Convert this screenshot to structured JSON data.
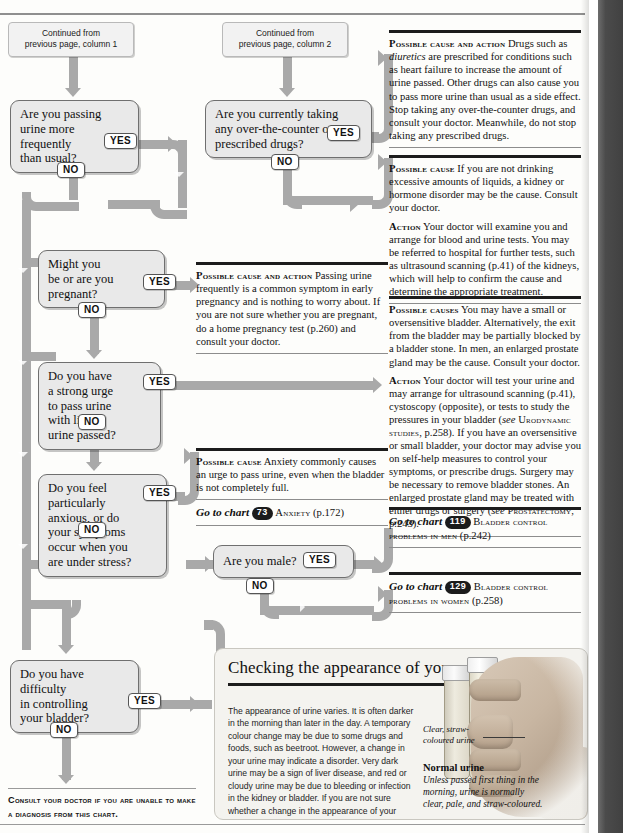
{
  "continued": {
    "col1": "Continued from\nprevious page, column 1",
    "col2": "Continued from\nprevious page, column 2"
  },
  "answers": {
    "yes": "YES",
    "no": "NO"
  },
  "questions": {
    "q_frequency": "Are you passing\nurine more\nfrequently\nthan usual?",
    "q_drugs": "Are you currently taking\nany over-the-counter or\nprescribed drugs?",
    "q_pregnant": "Might you\nbe or are you\npregnant?",
    "q_urge": "Do you have\na strong urge\nto pass urine\nwith little\nurine passed?",
    "q_anxious": "Do you feel\nparticularly\nanxious, or do\nyour symptoms\noccur when you\nare under stress?",
    "q_bladder_control": "Do you have\ndifficulty\nin controlling\nyour bladder?",
    "q_male": "Are you male?"
  },
  "advice": {
    "drugs_yes": {
      "heading": "Possible cause and action",
      "body_1": "Drugs such as ",
      "body_italic": "diuretics",
      "body_2": " are prescribed for conditions such as heart failure to increase the amount of urine passed. Other drugs can also cause you to pass more urine than usual as a side effect. Stop taking any over-the-counter drugs, and consult your doctor. Meanwhile, do not stop taking any prescribed drugs."
    },
    "drugs_no": {
      "heading": "Possible cause",
      "body": "If you are not drinking excessive amounts of liquids, a kidney or hormone disorder may be the cause. Consult your doctor.",
      "action_heading": "Action",
      "action_body": "Your doctor will examine you and arrange for blood and urine tests. You may be referred to hospital for further tests, such as ultrasound scanning (p.41) of the kidneys, which will help to confirm the cause and determine the appropriate treatment."
    },
    "pregnant_yes": {
      "heading": "Possible cause and action",
      "body": "Passing urine frequently is a common symptom in early pregnancy and is nothing to worry about. If you are not sure whether you are pregnant, do a home pregnancy test (p.260) and consult your doctor."
    },
    "urge_yes": {
      "heading": "Possible causes",
      "body": "You may have a small or oversensitive bladder. Alternatively, the exit from the bladder may be partially blocked by a bladder stone. In men, an enlarged prostate gland may be the cause. Consult your doctor.",
      "action_heading": "Action",
      "action_1": "Your doctor will test your urine and may arrange for ultrasound scanning (p.41), cystoscopy (opposite), or tests to study the pressures in your bladder (",
      "action_see": "see",
      "action_ref": "Urodynamic studies",
      "action_2": ", p.258). If you have an oversensitive or small bladder, your doctor may advise you on self-help measures to control your symptoms, or prescribe drugs. Surgery may be necessary to remove bladder stones. An enlarged prostate gland may be treated with either drugs or surgery (",
      "action_see2": "see",
      "action_ref2": "Prostatectomy",
      "action_3": ", p.243)."
    },
    "anxious_yes": {
      "heading": "Possible cause",
      "body": "Anxiety commonly causes an urge to pass urine, even when the bladder is not completely full.",
      "goto_prefix": "Go to chart",
      "goto_number": "73",
      "goto_title": "Anxiety",
      "goto_page": "(p.172)"
    },
    "male_yes": {
      "goto_prefix": "Go to chart",
      "goto_number": "119",
      "goto_title": "Bladder control problems in men",
      "goto_page": "(p.242)"
    },
    "male_no": {
      "goto_prefix": "Go to chart",
      "goto_number": "129",
      "goto_title": "Bladder control problems in women",
      "goto_page": "(p.258)"
    }
  },
  "footnote": "Consult your doctor if you are unable to make a diagnosis from this chart.",
  "panel": {
    "title": "Checking the appearance of your urine",
    "body": "The appearance of urine varies. It is often darker in the morning than later in the day. A temporary colour change may be due to some drugs and foods, such as beetroot. However, a change in your urine may indicate a disorder. Very dark urine may be a sign of liver disease, and red or cloudy urine may be due to bleeding or infection in the kidney or bladder. If you are not sure whether a change in the appearance of your urine is normal, consult your doctor.",
    "leader_label": "Clear, straw-\ncoloured urine",
    "caption_title": "Normal urine",
    "caption_sub": "Unless passed first thing in the morning, urine is normally clear, pale, and straw-coloured."
  },
  "colors": {
    "pipe": "#a9a9a9",
    "box_fill": "#e9e9e9",
    "box_border": "#6f6f6f",
    "rule_dark": "#1c1c1c",
    "panel_bg": "#f4f3ef"
  }
}
